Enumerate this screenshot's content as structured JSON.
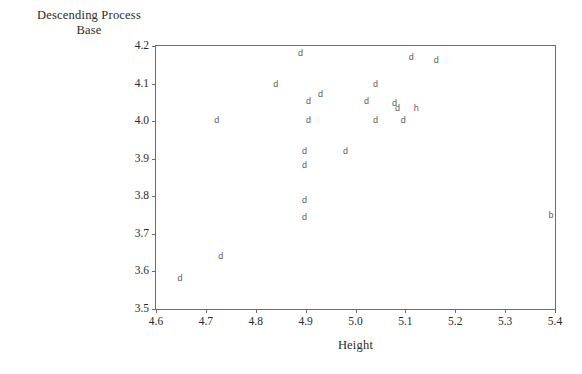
{
  "chart_data": {
    "type": "scatter",
    "title": "",
    "ylabel": "Descending Process Base",
    "ylabel_lines": [
      "Descending Process",
      "Base"
    ],
    "xlabel": "Height",
    "xlim": [
      4.6,
      5.4
    ],
    "ylim": [
      3.5,
      4.2
    ],
    "xticks": [
      "4.6",
      "4.7",
      "4.8",
      "4.9",
      "5.0",
      "5.1",
      "5.2",
      "5.3",
      "5.4"
    ],
    "xtick_values": [
      4.6,
      4.7,
      4.8,
      4.9,
      5.0,
      5.1,
      5.2,
      5.3,
      5.4
    ],
    "yticks": [
      "3.5",
      "3.6",
      "3.7",
      "3.8",
      "3.9",
      "4.0",
      "4.1",
      "4.2"
    ],
    "ytick_values": [
      3.5,
      3.6,
      3.7,
      3.8,
      3.9,
      4.0,
      4.1,
      4.2
    ],
    "grid": false,
    "legend": "none",
    "marker_style": "text-glyph",
    "points": [
      {
        "x": 4.648,
        "y": 3.582,
        "label": "d"
      },
      {
        "x": 4.73,
        "y": 3.64,
        "label": "d"
      },
      {
        "x": 4.722,
        "y": 4.003,
        "label": "d"
      },
      {
        "x": 4.84,
        "y": 4.1,
        "label": "d"
      },
      {
        "x": 4.89,
        "y": 4.182,
        "label": "d"
      },
      {
        "x": 4.906,
        "y": 4.053,
        "label": "d"
      },
      {
        "x": 4.906,
        "y": 4.003,
        "label": "d"
      },
      {
        "x": 4.898,
        "y": 3.921,
        "label": "d"
      },
      {
        "x": 4.898,
        "y": 3.884,
        "label": "d"
      },
      {
        "x": 4.898,
        "y": 3.789,
        "label": "d"
      },
      {
        "x": 4.898,
        "y": 3.745,
        "label": "d"
      },
      {
        "x": 4.93,
        "y": 4.072,
        "label": "d"
      },
      {
        "x": 4.98,
        "y": 3.921,
        "label": "d"
      },
      {
        "x": 5.022,
        "y": 4.053,
        "label": "d"
      },
      {
        "x": 5.04,
        "y": 4.1,
        "label": "d"
      },
      {
        "x": 5.04,
        "y": 4.003,
        "label": "d"
      },
      {
        "x": 5.078,
        "y": 4.047,
        "label": "d"
      },
      {
        "x": 5.084,
        "y": 4.034,
        "label": "d"
      },
      {
        "x": 5.096,
        "y": 4.003,
        "label": "d"
      },
      {
        "x": 5.112,
        "y": 4.172,
        "label": "d"
      },
      {
        "x": 5.122,
        "y": 4.034,
        "label": "h"
      },
      {
        "x": 5.162,
        "y": 4.163,
        "label": "d"
      },
      {
        "x": 5.392,
        "y": 3.75,
        "label": "b"
      }
    ]
  },
  "colors": {
    "axis": "#6d6d6d",
    "text": "#2b2b2b",
    "marker": "#5d5d5d",
    "background": "#ffffff"
  }
}
